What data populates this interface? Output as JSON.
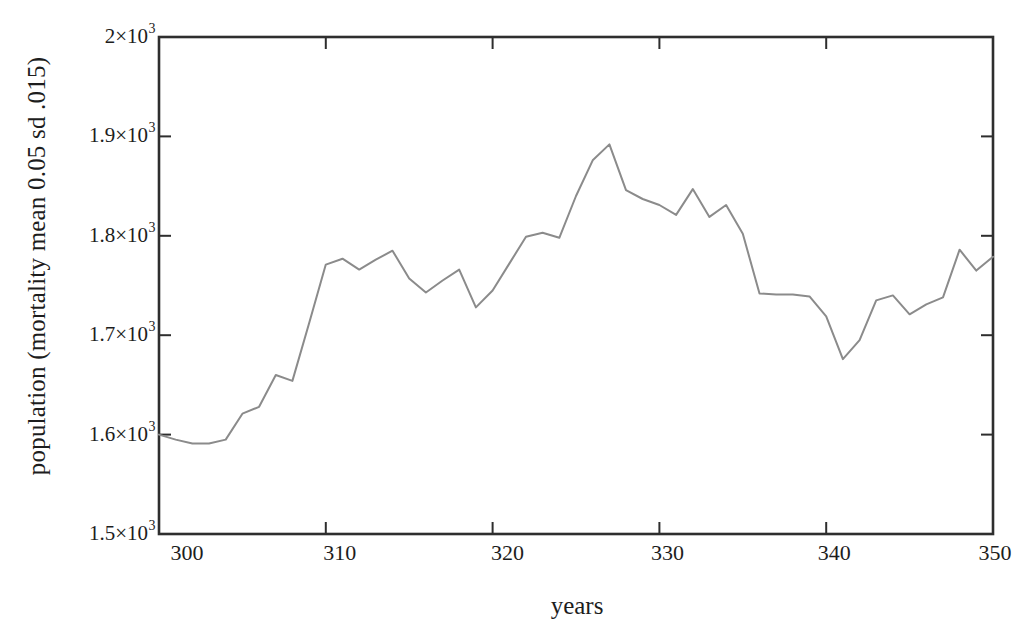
{
  "figure": {
    "background": "#ffffff"
  },
  "chart_data": {
    "type": "line",
    "title": "",
    "xlabel": "years",
    "ylabel": "population (mortality mean 0.05 sd .015)",
    "xlim": [
      300,
      350
    ],
    "ylim": [
      1500,
      2000
    ],
    "grid": false,
    "box": true,
    "tick_direction": "in",
    "legend": "none",
    "line_color": "#8b8b8b",
    "axis_color": "#2e2e2e",
    "text_color": "#1d1d1d",
    "x": [
      300,
      301,
      302,
      303,
      304,
      305,
      306,
      307,
      308,
      309,
      310,
      311,
      312,
      313,
      314,
      315,
      316,
      317,
      318,
      319,
      320,
      321,
      322,
      323,
      324,
      325,
      326,
      327,
      328,
      329,
      330,
      331,
      332,
      333,
      334,
      335,
      336,
      337,
      338,
      339,
      340,
      341,
      342,
      343,
      344,
      345,
      346,
      347,
      348,
      349,
      350
    ],
    "series": [
      {
        "name": "population",
        "values": [
          1600,
          1595,
          1591,
          1591,
          1595,
          1621,
          1628,
          1660,
          1654,
          1712,
          1771,
          1777,
          1766,
          1776,
          1785,
          1757,
          1743,
          1755,
          1766,
          1728,
          1745,
          1772,
          1799,
          1803,
          1798,
          1840,
          1876,
          1892,
          1846,
          1837,
          1831,
          1821,
          1847,
          1819,
          1831,
          1802,
          1742,
          1741,
          1741,
          1739,
          1719,
          1676,
          1695,
          1735,
          1740,
          1721,
          1731,
          1738,
          1786,
          1765,
          1779
        ]
      }
    ],
    "x_ticks": [
      {
        "v": 300,
        "label": "300"
      },
      {
        "v": 310,
        "label": "310"
      },
      {
        "v": 320,
        "label": "320"
      },
      {
        "v": 330,
        "label": "330"
      },
      {
        "v": 340,
        "label": "340"
      },
      {
        "v": 350,
        "label": "350"
      }
    ],
    "y_ticks": [
      {
        "v": 1500,
        "base": "1.5×10",
        "exp": "3"
      },
      {
        "v": 1600,
        "base": "1.6×10",
        "exp": "3"
      },
      {
        "v": 1700,
        "base": "1.7×10",
        "exp": "3"
      },
      {
        "v": 1800,
        "base": "1.8×10",
        "exp": "3"
      },
      {
        "v": 1900,
        "base": "1.9×10",
        "exp": "3"
      },
      {
        "v": 2000,
        "base": "2×10",
        "exp": "3"
      }
    ],
    "x_tick_label_dx": [
      28,
      14,
      15,
      8,
      8,
      2
    ]
  }
}
